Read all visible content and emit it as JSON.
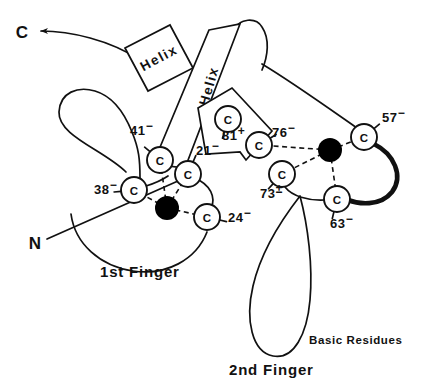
{
  "figure": {
    "domain_type": "diagram",
    "background_color": "#ffffff",
    "line_color": "#111111",
    "zinc_color": "#000000"
  },
  "termini": [
    {
      "id": "c-term",
      "label": "C",
      "x": 22,
      "y": 32
    },
    {
      "id": "n-term",
      "label": "N",
      "x": 35,
      "y": 243
    }
  ],
  "helices": [
    {
      "id": "helix-1",
      "label": "Helix"
    },
    {
      "id": "helix-2",
      "label": "Helix"
    }
  ],
  "cysteines": [
    {
      "id": "cys-41",
      "letter": "C",
      "label": "41",
      "charge": "−",
      "cx": 160,
      "cy": 160,
      "r": 13,
      "label_x": 130,
      "label_y": 135
    },
    {
      "id": "cys-21",
      "letter": "C",
      "label": "21",
      "charge": "−",
      "cx": 188,
      "cy": 174,
      "r": 13,
      "label_x": 196,
      "label_y": 155
    },
    {
      "id": "cys-38",
      "letter": "C",
      "label": "38",
      "charge": "−",
      "cx": 134,
      "cy": 190,
      "r": 13,
      "label_x": 94,
      "label_y": 194
    },
    {
      "id": "cys-24",
      "letter": "C",
      "label": "24",
      "charge": "−",
      "cx": 207,
      "cy": 217,
      "r": 13,
      "label_x": 228,
      "label_y": 222
    },
    {
      "id": "cys-81",
      "letter": "C",
      "label": "81",
      "charge": "+",
      "cx": 228,
      "cy": 119,
      "r": 13,
      "label_x": 222,
      "label_y": 140
    },
    {
      "id": "cys-76",
      "letter": "C",
      "label": "76",
      "charge": "−",
      "cx": 259,
      "cy": 145,
      "r": 13,
      "label_x": 272,
      "label_y": 137
    },
    {
      "id": "cys-73",
      "letter": "C",
      "label": "73",
      "charge": "±",
      "cx": 282,
      "cy": 174,
      "r": 13,
      "label_x": 260,
      "label_y": 198
    },
    {
      "id": "cys-57",
      "letter": "C",
      "label": "57",
      "charge": "−",
      "cx": 364,
      "cy": 137,
      "r": 13,
      "label_x": 382,
      "label_y": 122
    },
    {
      "id": "cys-63",
      "letter": "C",
      "label": "63",
      "charge": "−",
      "cx": 337,
      "cy": 199,
      "r": 13,
      "label_x": 330,
      "label_y": 228
    }
  ],
  "zinc_ions": [
    {
      "id": "zinc-1",
      "cx": 167,
      "cy": 208,
      "r": 12,
      "finger": "1st Finger"
    },
    {
      "id": "zinc-2",
      "cx": 330,
      "cy": 150,
      "r": 12,
      "finger": "2nd Finger"
    }
  ],
  "coordination_bonds": [
    {
      "id": "bond-zn1-cys41",
      "from": "zinc-1",
      "to": "cys-41"
    },
    {
      "id": "bond-zn1-cys21",
      "from": "zinc-1",
      "to": "cys-21"
    },
    {
      "id": "bond-zn1-cys38",
      "from": "zinc-1",
      "to": "cys-38"
    },
    {
      "id": "bond-zn1-cys24",
      "from": "zinc-1",
      "to": "cys-24"
    },
    {
      "id": "bond-zn2-cys76",
      "from": "zinc-2",
      "to": "cys-76"
    },
    {
      "id": "bond-zn2-cys73",
      "from": "zinc-2",
      "to": "cys-73"
    },
    {
      "id": "bond-zn2-cys57",
      "from": "zinc-2",
      "to": "cys-57"
    },
    {
      "id": "bond-zn2-cys63",
      "from": "zinc-2",
      "to": "cys-63"
    }
  ],
  "captions": [
    {
      "id": "caption-1st-finger",
      "text": "1st Finger",
      "x": 100,
      "y": 277
    },
    {
      "id": "caption-2nd-finger",
      "text": "2nd Finger",
      "x": 229,
      "y": 375
    },
    {
      "id": "caption-basic-residues",
      "text": "Basic Residues",
      "x": 309,
      "y": 344
    }
  ]
}
